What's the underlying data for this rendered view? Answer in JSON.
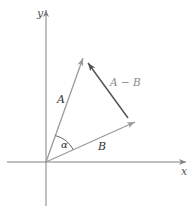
{
  "diagram": {
    "type": "vector-subtraction",
    "axes": {
      "x_label": "x",
      "y_label": "y"
    },
    "vectors": {
      "A": {
        "label": "A",
        "from": [
          0,
          0
        ],
        "to": [
          37,
          104
        ]
      },
      "B": {
        "label": "B",
        "from": [
          0,
          0
        ],
        "to": [
          89,
          40
        ]
      },
      "A_minus_B": {
        "label": "A − B",
        "from": "tip of B",
        "to": "tip of A"
      }
    },
    "angle": {
      "label": "α",
      "between": [
        "A",
        "B"
      ]
    },
    "colors": {
      "axis": "#808080",
      "vector_A": "#9a9a9a",
      "vector_B": "#9a9a9a",
      "vector_A_minus_B": "#505050",
      "label_light": "#8a8a8a",
      "label_dark": "#333333"
    }
  }
}
